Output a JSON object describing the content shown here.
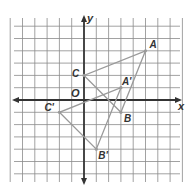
{
  "diagram": {
    "type": "coordinate-plane-translation",
    "axes": {
      "x_label": "x",
      "y_label": "y",
      "origin_label": "O",
      "x_range": [
        -6,
        8
      ],
      "y_range": [
        -6,
        7
      ]
    },
    "colors": {
      "grid": "#8a8a8a",
      "axis": "#333333",
      "triangle": "#9a9a9a",
      "label": "#333333"
    },
    "preimage": {
      "name": "triangle-ABC",
      "points": [
        {
          "label": "A",
          "x": 5,
          "y": 4
        },
        {
          "label": "B",
          "x": 3,
          "y": -1
        },
        {
          "label": "C",
          "x": 0,
          "y": 2
        }
      ]
    },
    "image": {
      "name": "triangle-A'B'C'",
      "points": [
        {
          "label": "A'",
          "x": 3,
          "y": 1
        },
        {
          "label": "B'",
          "x": 1,
          "y": -4
        },
        {
          "label": "C'",
          "x": -2,
          "y": -1
        }
      ]
    }
  }
}
